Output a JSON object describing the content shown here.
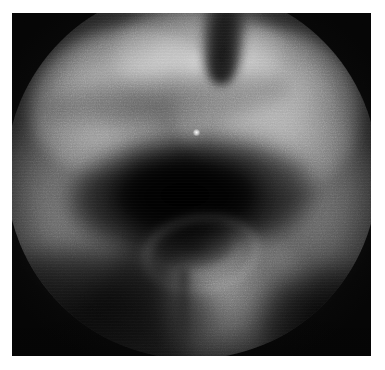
{
  "image": {
    "kind": "arthroscopic-photograph",
    "modality": "Arthroscopy",
    "color_mode": "Grayscale",
    "caption": "",
    "alt_text": "Grayscale arthroscopic view with circular field of view showing bright condylar tissue above a dark central joint cavity",
    "canvas": {
      "width_px": 385,
      "height_px": 370,
      "background_color": "#ffffff"
    },
    "frame": {
      "left_px": 12,
      "top_px": 13,
      "width_px": 359,
      "height_px": 343,
      "border_color": "#ffffff"
    },
    "field_of_view": {
      "shape": "circle",
      "center_x_px": 180,
      "center_y_px": 160,
      "radius_px": 186,
      "vignette": "heavy"
    },
    "tone": {
      "darkest_hex": "#050505",
      "shadow_hex": "#141414",
      "midtone_hex": "#3f3f3f",
      "lightmid_hex": "#6e6e6e",
      "highlight_hex": "#9e9e9e",
      "brightest_hex": "#a8a8a8",
      "specular_hex": "#ffffff"
    },
    "features": [
      {
        "id": "lobe-upper-left",
        "label": "Upper-left bright tissue lobe",
        "brightness_hex": "#9e9e9e"
      },
      {
        "id": "lobe-upper-right",
        "label": "Upper-right bright tissue lobe",
        "brightness_hex": "#a8a8a8"
      },
      {
        "id": "ridge-top",
        "label": "Top central bright ridge",
        "brightness_hex": "#acacac"
      },
      {
        "id": "notch",
        "label": "Dark intercondylar notch",
        "brightness_hex": "#0e0e0e"
      },
      {
        "id": "wall-left",
        "label": "Left lateral grey wall",
        "brightness_hex": "#606060"
      },
      {
        "id": "wall-right",
        "label": "Right lateral grey wall",
        "brightness_hex": "#5c5c5c"
      },
      {
        "id": "cavity",
        "label": "Dark central joint cavity",
        "brightness_hex": "#030303"
      },
      {
        "id": "ring-structure",
        "label": "Faint ring-shaped structure",
        "brightness_hex": "#787878"
      },
      {
        "id": "lobe-lower-center",
        "label": "Lower-center bright tissue lobe",
        "brightness_hex": "#707070"
      },
      {
        "id": "specular",
        "label": "Specular light reflection",
        "brightness_hex": "#ffffff",
        "x_px": 202,
        "y_px": 158
      }
    ],
    "texture": {
      "grain": "high",
      "scanlines": "visible",
      "noise_label": "sensor-noise"
    }
  }
}
